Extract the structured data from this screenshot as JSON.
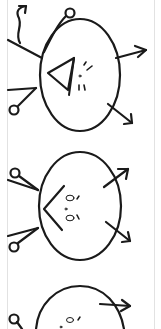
{
  "panel": {
    "background": "#ffffff",
    "frame_color": "#e2e2e2",
    "ink_color": "#1a1a1a"
  },
  "sketches": [
    {
      "label": "sketch-1",
      "description": "hand-drawn face with triangle nose, two antennae with circle tips, wavy arrow, two outward arrows"
    },
    {
      "label": "sketch-2",
      "description": "hand-drawn face with chevron, two dot eyes, two antennae with circle tips, two outward arrows"
    },
    {
      "label": "sketch-3",
      "description": "partially visible hand-drawn face with antenna and arrow"
    }
  ]
}
